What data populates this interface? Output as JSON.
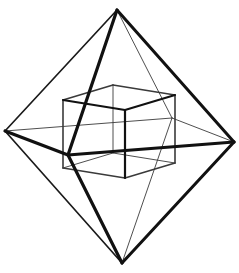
{
  "figure": {
    "caption": "",
    "background_color": "#ffffff",
    "line_color": "#111111",
    "thin_line_color": "#3a3a3a",
    "thick_stroke_width": 3.2,
    "medium_stroke_width": 2.0,
    "thin_stroke_width": 0.9,
    "canvas": {
      "width": 239,
      "height": 273
    }
  },
  "chart_data": {
    "type": "line",
    "xlabel": "",
    "ylabel": "",
    "grid": false,
    "legend": "none",
    "xlim": [
      0,
      239
    ],
    "ylim": [
      0,
      273
    ],
    "vertices": {
      "octahedron": {
        "top": [
          117,
          10
        ],
        "bottom": [
          122,
          263
        ],
        "left": [
          5,
          131
        ],
        "right": [
          234,
          142
        ],
        "front": [
          68,
          155
        ],
        "back": [
          172,
          118
        ]
      },
      "cube": {
        "front_top_left": [
          63,
          100
        ],
        "front_top_right": [
          125,
          110
        ],
        "front_bottom_right": [
          125,
          178
        ],
        "front_bottom_left": [
          63,
          168
        ],
        "back_top_left": [
          113,
          85
        ],
        "back_top_right": [
          175,
          95
        ],
        "back_bottom_right": [
          175,
          163
        ],
        "back_bottom_left": [
          113,
          153
        ]
      }
    },
    "edges": {
      "octahedron_front_faces": [
        [
          "top",
          "front"
        ],
        [
          "front",
          "bottom"
        ],
        [
          "left",
          "front"
        ],
        [
          "front",
          "right"
        ],
        [
          "top",
          "left"
        ],
        [
          "left",
          "bottom"
        ],
        [
          "top",
          "right"
        ],
        [
          "right",
          "bottom"
        ]
      ],
      "octahedron_back_faces": [
        [
          "top",
          "back"
        ],
        [
          "back",
          "bottom"
        ],
        [
          "left",
          "back"
        ],
        [
          "back",
          "right"
        ]
      ],
      "cube_visible": [
        [
          "front_top_left",
          "front_top_right"
        ],
        [
          "front_top_right",
          "front_bottom_right"
        ],
        [
          "front_bottom_right",
          "front_bottom_left"
        ],
        [
          "front_bottom_left",
          "front_top_left"
        ],
        [
          "front_top_left",
          "back_top_left"
        ],
        [
          "front_top_right",
          "back_top_right"
        ],
        [
          "back_top_left",
          "back_top_right"
        ],
        [
          "back_top_right",
          "back_bottom_right"
        ],
        [
          "front_bottom_right",
          "back_bottom_right"
        ]
      ],
      "cube_hidden": [
        [
          "back_bottom_left",
          "back_bottom_right"
        ],
        [
          "back_top_left",
          "back_bottom_left"
        ],
        [
          "front_bottom_left",
          "back_bottom_left"
        ]
      ]
    }
  }
}
